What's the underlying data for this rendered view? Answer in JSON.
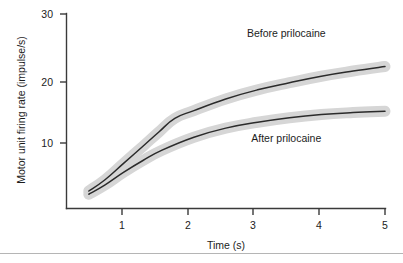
{
  "chart_data": {
    "type": "line",
    "title": "",
    "xlabel": "Time (s)",
    "ylabel": "Motor unit firing rate (impulse/s)",
    "xlim": [
      0,
      5.2
    ],
    "ylim": [
      0,
      30
    ],
    "xticks": [
      1,
      2,
      3,
      4,
      5
    ],
    "xtick_labels": [
      "1",
      "2",
      "3",
      "4",
      "5"
    ],
    "yticks": [
      10,
      20,
      30
    ],
    "ytick_labels": [
      "10",
      "20",
      "30"
    ],
    "grid": false,
    "legend": "inline-annotations",
    "series": [
      {
        "name": "Before prilocaine",
        "style": "dark line with light grey halo",
        "x": [
          0.35,
          0.6,
          0.9,
          1.2,
          1.45,
          1.7,
          2.0,
          2.5,
          3.0,
          3.5,
          4.0,
          4.5,
          5.0
        ],
        "y": [
          2.7,
          4.4,
          7.0,
          9.6,
          11.8,
          13.9,
          15.1,
          16.9,
          18.3,
          19.4,
          20.4,
          21.2,
          21.9
        ]
      },
      {
        "name": "After prilocaine",
        "style": "dark line with light grey halo",
        "x": [
          0.35,
          0.6,
          0.9,
          1.2,
          1.5,
          2.0,
          2.5,
          3.0,
          3.5,
          4.0,
          4.5,
          5.0
        ],
        "y": [
          2.2,
          3.6,
          5.6,
          7.4,
          9.0,
          11.0,
          12.4,
          13.3,
          14.0,
          14.5,
          14.8,
          15.0
        ]
      }
    ],
    "annotations": [
      {
        "text": "Before prilocaine",
        "x": 3.45,
        "y": 26.4
      },
      {
        "text": "After prilocaine",
        "x": 3.45,
        "y": 10.2
      }
    ]
  }
}
